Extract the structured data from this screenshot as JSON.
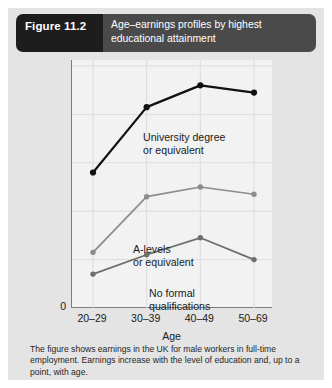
{
  "figure": {
    "number_label": "Figure 11.2",
    "title": "Age–earnings profiles by highest educational attainment",
    "caption": "The figure shows earnings in the UK for male workers in full-time employment. Earnings increase with the level of education and, up to a point, with age.",
    "zero_origin_label": "0"
  },
  "colors": {
    "figure_number_bg": "#1d1d1d",
    "title_bg": "#4a4a4a",
    "card_bg": "#e4e4e4",
    "plot_bg": "#f2f2f2",
    "axis": "#7b7b7b",
    "gridline": "#dcdcdc",
    "series_university": "#111111",
    "series_alevels": "#8c8c8c",
    "series_noformal": "#6e6e6e"
  },
  "chart_data": {
    "type": "line",
    "title": "Age–earnings profiles by highest educational attainment",
    "xlabel": "Age",
    "ylabel": "Average weekly earnings",
    "categories": [
      "20–29",
      "30–39",
      "40–49",
      "50–69"
    ],
    "ylim": [
      0,
      100
    ],
    "xlim_categorical": true,
    "grid": true,
    "legend": "inline-annotations",
    "series": [
      {
        "name": "University degree or equivalent",
        "label_lines": "University degree\nor equivalent",
        "color": "#111111",
        "values": [
          56,
          83,
          92,
          89
        ]
      },
      {
        "name": "A-levels or equivalent",
        "label_lines": "A-levels\nor equivalent",
        "color": "#8c8c8c",
        "values": [
          23,
          46,
          50,
          47
        ]
      },
      {
        "name": "No formal qualifications",
        "label_lines": "No formal\nqualifications",
        "color": "#6e6e6e",
        "values": [
          14,
          22,
          29,
          20
        ]
      }
    ]
  }
}
